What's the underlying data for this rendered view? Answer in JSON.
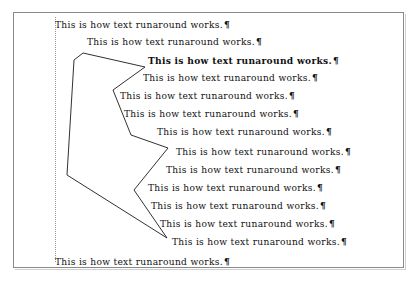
{
  "document": {
    "title": "Text runaround demonstration page",
    "page_border_color": "#8a8a8a",
    "background_color": "#ffffff",
    "text_color": "#111111",
    "margin_guide_color": "#9a9a9a",
    "shape_stroke_color": "#1a1a1a",
    "paragraph_mark": "¶",
    "body_text": "This is how text runaround works.",
    "lines": [
      {
        "text": "This is how text runaround works.",
        "mark": "¶",
        "x": 55,
        "y": 20
      },
      {
        "text": "This is how text runaround works.",
        "mark": "¶",
        "x": 87,
        "y": 37
      },
      {
        "text": "This is how text runaround works.",
        "mark": "¶",
        "x": 148,
        "y": 56
      },
      {
        "text": "This is how text runaround works.",
        "mark": "¶",
        "x": 143,
        "y": 73
      },
      {
        "text": "This is how text runaround works.",
        "mark": "¶",
        "x": 120,
        "y": 91
      },
      {
        "text": "This is how text runaround works.",
        "mark": "¶",
        "x": 124,
        "y": 109
      },
      {
        "text": "This is how text runaround works.",
        "mark": "¶",
        "x": 157,
        "y": 127
      },
      {
        "text": "This is how text runaround works.",
        "mark": "¶",
        "x": 176,
        "y": 147
      },
      {
        "text": "This is how text runaround works.",
        "mark": "¶",
        "x": 166,
        "y": 165
      },
      {
        "text": "This is how text runaround works.",
        "mark": "¶",
        "x": 148,
        "y": 183
      },
      {
        "text": "This is how text runaround works.",
        "mark": "¶",
        "x": 151,
        "y": 201
      },
      {
        "text": "This is how text runaround works.",
        "mark": "¶",
        "x": 160,
        "y": 219
      },
      {
        "text": "This is how text runaround works.",
        "mark": "¶",
        "x": 172,
        "y": 237
      },
      {
        "text": "This is how text runaround works.",
        "mark": "¶",
        "x": 55,
        "y": 257
      }
    ],
    "shape": {
      "name": "runaround-polygon",
      "points": "83,53 145,67 113,90 131,135 168,148 134,190 167,238 67,175 74,60",
      "stroke_width": 0.9
    },
    "margin_guide": {
      "x": 55,
      "top": 17,
      "height": 245
    },
    "page_frame": {
      "x": 13,
      "y": 12,
      "width": 391,
      "height": 256
    }
  }
}
